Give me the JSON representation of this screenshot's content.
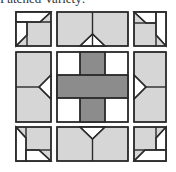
{
  "caption": "Patched Variety:",
  "colors": {
    "light": "#d6d6d6",
    "dark": "#8c8c8c",
    "white": "#ffffff",
    "stroke": "#2a2a2a"
  },
  "blocks": [
    {
      "id": "top-left",
      "type": "corner"
    },
    {
      "id": "top-center",
      "type": "edge"
    },
    {
      "id": "top-right",
      "type": "corner"
    },
    {
      "id": "middle-left",
      "type": "edge"
    },
    {
      "id": "center",
      "type": "cross"
    },
    {
      "id": "middle-right",
      "type": "edge"
    },
    {
      "id": "bottom-left",
      "type": "corner"
    },
    {
      "id": "bottom-center",
      "type": "edge"
    },
    {
      "id": "bottom-right",
      "type": "corner"
    }
  ]
}
